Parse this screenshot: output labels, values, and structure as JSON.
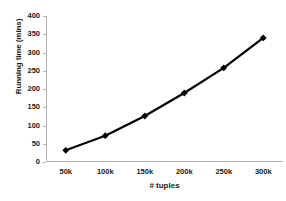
{
  "chart_data": {
    "type": "line",
    "title": "",
    "xlabel": "# tuples",
    "ylabel": "Running time (mins)",
    "x_categories": [
      "50k",
      "100k",
      "150k",
      "200k",
      "250k",
      "300k"
    ],
    "x_values": [
      50000,
      100000,
      150000,
      200000,
      250000,
      300000
    ],
    "values": [
      32,
      72,
      126,
      189,
      258,
      340
    ],
    "series": [
      {
        "name": "Running time",
        "values": [
          32,
          72,
          126,
          189,
          258,
          340
        ]
      }
    ],
    "ylim": [
      0,
      400
    ],
    "y_ticks": [
      0,
      50,
      100,
      150,
      200,
      250,
      300,
      350,
      400
    ],
    "y_tick_labels": [
      "0",
      "50",
      "100",
      "150",
      "200",
      "250",
      "300",
      "350",
      "400"
    ],
    "grid": false,
    "legend": "none",
    "marker": "diamond",
    "line_color": "#000000",
    "marker_color": "#000000",
    "axis_color": "#b3b3b3",
    "background_color": "#ffffff",
    "text_color": "#1a1a1a"
  }
}
